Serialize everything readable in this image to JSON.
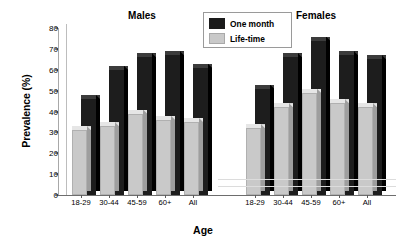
{
  "chart_data": {
    "type": "bar",
    "title": "",
    "xlabel": "Age",
    "ylabel": "Prevalence (%)",
    "ylim": [
      0,
      80
    ],
    "ytick_labels": [
      "0",
      "10",
      "20",
      "30",
      "40",
      "50",
      "60",
      "70",
      "80"
    ],
    "ytick_values": [
      0,
      10,
      20,
      30,
      40,
      50,
      60,
      70,
      80
    ],
    "grid": false,
    "legend_position": "top-center",
    "panels": [
      {
        "name": "Males",
        "categories": [
          "18-29",
          "30-44",
          "45-59",
          "60+",
          "All"
        ],
        "series": [
          {
            "name": "One month",
            "color": "#1b1b1b",
            "values": [
              46,
              60,
              66,
              67,
              61
            ]
          },
          {
            "name": "Life-time",
            "color": "#c9c9c9",
            "values": [
              31,
              33,
              39,
              36,
              35
            ]
          }
        ]
      },
      {
        "name": "Females",
        "categories": [
          "18-29",
          "30-44",
          "45-59",
          "60+",
          "All"
        ],
        "series": [
          {
            "name": "One month",
            "color": "#1b1b1b",
            "values": [
              51,
              66,
              74,
              67,
              65
            ]
          },
          {
            "name": "Life-time",
            "color": "#c9c9c9",
            "values": [
              32,
              42,
              49,
              44,
              42
            ]
          }
        ]
      }
    ],
    "legend": [
      {
        "label": "One month",
        "color": "#1b1b1b"
      },
      {
        "label": "Life-time",
        "color": "#c9c9c9"
      }
    ]
  }
}
